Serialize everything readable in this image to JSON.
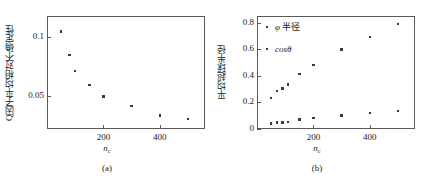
{
  "figure": {
    "panels": [
      {
        "caption": "(a)",
        "xlabel_base": "n",
        "xlabel_sub": "c",
        "ylabel": "Q因子平均相对不确定性",
        "xticks": [
          200,
          400
        ],
        "xtick_labels": [
          "200",
          "400"
        ],
        "yticks": [
          0.05,
          0.1
        ],
        "ytick_labels": [
          "0.05",
          "0.1"
        ]
      },
      {
        "caption": "(b)",
        "xlabel_base": "n",
        "xlabel_sub": "c",
        "ylabel": "平均超球半径",
        "xticks": [
          200,
          400
        ],
        "xtick_labels": [
          "200",
          "400"
        ],
        "yticks": [
          0,
          0.2,
          0.4,
          0.6,
          0.8
        ],
        "ytick_labels": [
          "0",
          "0.2",
          "0.4",
          "0.6",
          "0.8"
        ],
        "legend": [
          {
            "label_math": "φ",
            "label_text": " 半径",
            "name": "phi-radius"
          },
          {
            "label_math": "cosθ",
            "label_text": "",
            "name": "cos-theta"
          }
        ]
      }
    ]
  },
  "chart_data": [
    {
      "type": "scatter",
      "title": "",
      "panel": "(a)",
      "xlabel": "n_c",
      "ylabel": "Q因子平均相对不确定性",
      "xlim": [
        0,
        560
      ],
      "ylim": [
        0.022,
        0.118
      ],
      "grid": false,
      "legend_position": "none",
      "x": [
        50,
        80,
        100,
        150,
        200,
        300,
        400,
        500
      ],
      "y": [
        0.105,
        0.085,
        0.0715,
        0.0595,
        0.0495,
        0.0415,
        0.0335,
        0.0305
      ]
    },
    {
      "type": "scatter",
      "title": "",
      "panel": "(b)",
      "xlabel": "n_c",
      "ylabel": "平均超球半径",
      "xlim": [
        0,
        560
      ],
      "ylim": [
        0,
        0.85
      ],
      "grid": false,
      "legend_position": "top-left",
      "x": [
        50,
        70,
        90,
        110,
        150,
        200,
        300,
        400,
        500
      ],
      "series": [
        {
          "name": "φ 半径",
          "values": [
            0.232,
            0.285,
            0.305,
            0.335,
            0.412,
            0.48,
            0.598,
            0.693,
            0.788
          ]
        },
        {
          "name": "cosθ",
          "values": [
            0.04,
            0.048,
            0.05,
            0.055,
            0.072,
            0.082,
            0.103,
            0.122,
            0.137
          ]
        }
      ]
    }
  ]
}
